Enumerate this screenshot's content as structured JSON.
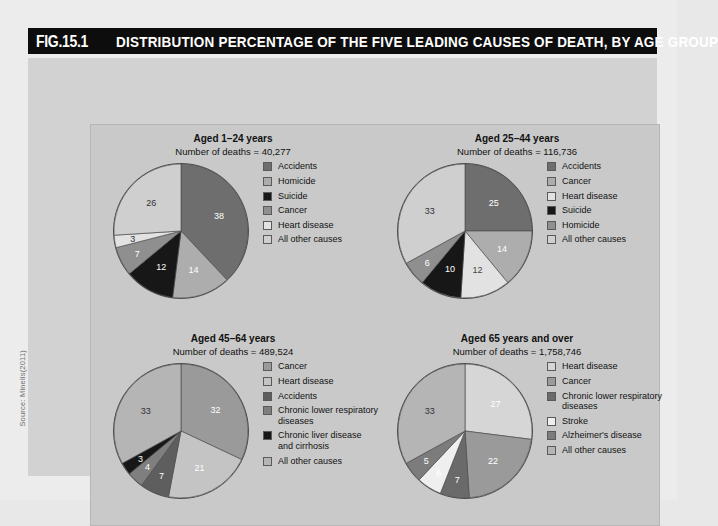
{
  "figure": {
    "number": "FIG.15.1",
    "title": "DISTRIBUTION PERCENTAGE OF THE FIVE LEADING CAUSES OF DEATH, BY AGE GROUP",
    "source": "Source: Minelis(2011)"
  },
  "palette": {
    "accidents": "#6e6e6e",
    "homicide": "#c9c9c9",
    "suicide": "#171717",
    "cancer": "#adadad",
    "heart_disease": "#e8e8e8",
    "all_other_causes": "#9a9a9a",
    "chronic_lower_respiratory": "#7f7f7f",
    "chronic_liver_disease": "#171717",
    "stroke": "#efefef",
    "alzheimers": "#555555",
    "panel_bg": "#c9c9c9",
    "frame_bg": "#d2d2d2",
    "title_bg": "#0d0d0d"
  },
  "chart_data": [
    {
      "type": "pie",
      "title": "Aged 1–24 years",
      "subtitle": "Number of deaths = 40,277",
      "categories": [
        "Accidents",
        "Homicide",
        "Suicide",
        "Cancer",
        "Heart disease",
        "All other causes"
      ],
      "values": [
        38,
        14,
        12,
        7,
        3,
        26
      ],
      "colors": [
        "#6e6e6e",
        "#adadad",
        "#171717",
        "#8f8f8f",
        "#e2e2e2",
        "#cfcfcf"
      ],
      "label_colors": [
        "#ffffff",
        "#ffffff",
        "#ffffff",
        "#ffffff",
        "#333333",
        "#333333"
      ],
      "legend_position": "right",
      "xlabel": "",
      "ylabel": ""
    },
    {
      "type": "pie",
      "title": "Aged 25–44 years",
      "subtitle": "Number of deaths = 116,736",
      "categories": [
        "Accidents",
        "Cancer",
        "Heart disease",
        "Suicide",
        "Homicide",
        "All other causes"
      ],
      "values": [
        25,
        14,
        12,
        10,
        6,
        33
      ],
      "colors": [
        "#6e6e6e",
        "#adadad",
        "#e2e2e2",
        "#171717",
        "#8f8f8f",
        "#cfcfcf"
      ],
      "label_colors": [
        "#ffffff",
        "#ffffff",
        "#444444",
        "#ffffff",
        "#ffffff",
        "#333333"
      ],
      "legend_position": "right",
      "xlabel": "",
      "ylabel": ""
    },
    {
      "type": "pie",
      "title": "Aged 45–64 years",
      "subtitle": "Number of deaths = 489,524",
      "categories": [
        "Cancer",
        "Heart disease",
        "Accidents",
        "Chronic lower respiratory diseases",
        "Chronic liver disease and cirrhosis",
        "All other causes"
      ],
      "values": [
        32,
        21,
        7,
        4,
        3,
        33
      ],
      "colors": [
        "#9a9a9a",
        "#c4c4c4",
        "#5e5e5e",
        "#7f7f7f",
        "#171717",
        "#b5b5b5"
      ],
      "label_colors": [
        "#ffffff",
        "#ffffff",
        "#ffffff",
        "#ffffff",
        "#ffffff",
        "#333333"
      ],
      "legend_position": "right",
      "xlabel": "",
      "ylabel": ""
    },
    {
      "type": "pie",
      "title": "Aged 65 years and over",
      "subtitle": "Number of deaths = 1,758,746",
      "categories": [
        "Heart disease",
        "Cancer",
        "Chronic lower respiratory diseases",
        "Stroke",
        "Alzheimer's disease",
        "All other causes"
      ],
      "values": [
        27,
        22,
        7,
        6,
        5,
        33
      ],
      "colors": [
        "#d6d6d6",
        "#9a9a9a",
        "#6a6a6a",
        "#efefef",
        "#7c7c7c",
        "#b5b5b5"
      ],
      "label_colors": [
        "#ffffff",
        "#ffffff",
        "#ffffff",
        "#ffffff",
        "#ffffff",
        "#333333"
      ],
      "legend_position": "right",
      "xlabel": "",
      "ylabel": ""
    }
  ]
}
